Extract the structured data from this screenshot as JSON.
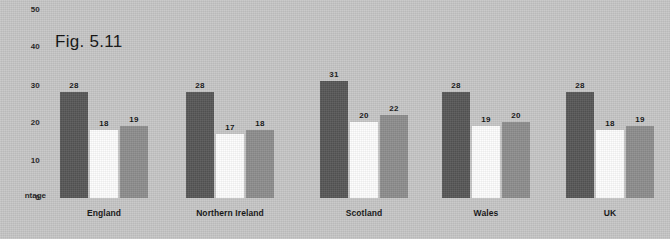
{
  "figure": {
    "title": "Fig. 5.11",
    "axis_title_visible_text": "ntage"
  },
  "axis": {
    "y_ticks": [
      "0",
      "10",
      "20",
      "30",
      "40",
      "50"
    ]
  },
  "colors": {
    "background": "#c6c6c6",
    "series_1": "#565656",
    "series_2": "#fdfdfd",
    "series_3": "#8d8d8d",
    "text": "#121212"
  },
  "chart_data": {
    "type": "bar",
    "title": "Fig. 5.11",
    "xlabel": "",
    "ylabel": "ntage",
    "ylim": [
      0,
      50
    ],
    "ytick_values": [
      0,
      10,
      20,
      30,
      40,
      50
    ],
    "grid": false,
    "legend": "none",
    "categories": [
      "England",
      "Northern Ireland",
      "Scotland",
      "Wales",
      "UK"
    ],
    "series": [
      {
        "name": "Series 1",
        "color": "#565656",
        "values": [
          28,
          28,
          31,
          28,
          28
        ]
      },
      {
        "name": "Series 2",
        "color": "#fdfdfd",
        "values": [
          18,
          17,
          20,
          19,
          18
        ]
      },
      {
        "name": "Series 3",
        "color": "#8d8d8d",
        "values": [
          19,
          18,
          22,
          20,
          19
        ]
      }
    ],
    "data_labels": [
      [
        "28",
        "18",
        "19"
      ],
      [
        "28",
        "17",
        "18"
      ],
      [
        "31",
        "20",
        "22"
      ],
      [
        "28",
        "19",
        "20"
      ],
      [
        "28",
        "18",
        "19"
      ]
    ]
  },
  "layout": {
    "baseline_y_px": 198,
    "px_per_unit": 3.78,
    "group_x_px": [
      60,
      186,
      320,
      442,
      566
    ],
    "bar_width_px": 28,
    "bar_gap_px": 2
  }
}
